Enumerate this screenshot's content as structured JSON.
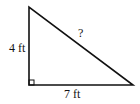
{
  "diagram": {
    "type": "right-triangle",
    "labels": {
      "vertical_leg": "4 ft",
      "horizontal_leg": "7 ft",
      "hypotenuse": "?"
    },
    "right_angle_marker": true,
    "colors": {
      "stroke": "#111111",
      "background": "#ffffff"
    }
  }
}
